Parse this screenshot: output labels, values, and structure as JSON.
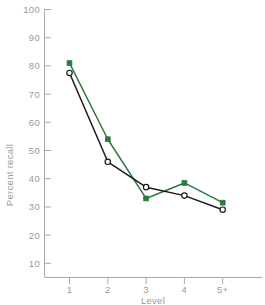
{
  "chart_data": {
    "type": "line",
    "title": "",
    "xlabel": "Level",
    "ylabel": "Percent recall",
    "categories": [
      "1",
      "2",
      "3",
      "4",
      "5+"
    ],
    "xtick_labels": [
      "1",
      "2",
      "3",
      "4",
      "5+"
    ],
    "ytick_labels": [
      "10",
      "20",
      "30",
      "40",
      "50",
      "60",
      "70",
      "80",
      "90",
      "100"
    ],
    "ytick_values": [
      10,
      20,
      30,
      40,
      50,
      60,
      70,
      80,
      90,
      100
    ],
    "ylim": [
      0,
      100
    ],
    "grid": false,
    "legend": "none",
    "series": [
      {
        "name": "green-series",
        "color": "#2d7a3e",
        "marker": "filled-square",
        "values": [
          81,
          54,
          33,
          38.5,
          31.5
        ]
      },
      {
        "name": "black-series",
        "color": "#1a1a1a",
        "marker": "open-circle",
        "values": [
          77.5,
          46,
          37,
          34,
          29
        ]
      }
    ]
  },
  "axes": {
    "y_axis_label": "Percent recall",
    "x_axis_label": "Level"
  },
  "colors": {
    "green": "#2d7a3e",
    "black": "#1a1a1a",
    "axis": "#a8a8a8",
    "text": "#9a9a9a",
    "background": "#ffffff"
  }
}
